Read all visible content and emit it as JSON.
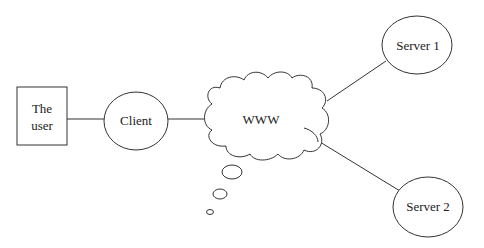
{
  "diagram": {
    "nodes": {
      "user": {
        "label_line1": "The",
        "label_line2": "user",
        "shape": "rectangle"
      },
      "client": {
        "label": "Client",
        "shape": "ellipse"
      },
      "www": {
        "label": "WWW",
        "shape": "cloud"
      },
      "server1": {
        "label": "Server 1",
        "shape": "ellipse"
      },
      "server2": {
        "label": "Server 2",
        "shape": "ellipse"
      }
    },
    "edges": [
      {
        "from": "user",
        "to": "client"
      },
      {
        "from": "client",
        "to": "www"
      },
      {
        "from": "www",
        "to": "server1"
      },
      {
        "from": "www",
        "to": "server2"
      }
    ],
    "thought_bubbles": 3,
    "colors": {
      "stroke": "#333333",
      "background": "#ffffff"
    }
  }
}
